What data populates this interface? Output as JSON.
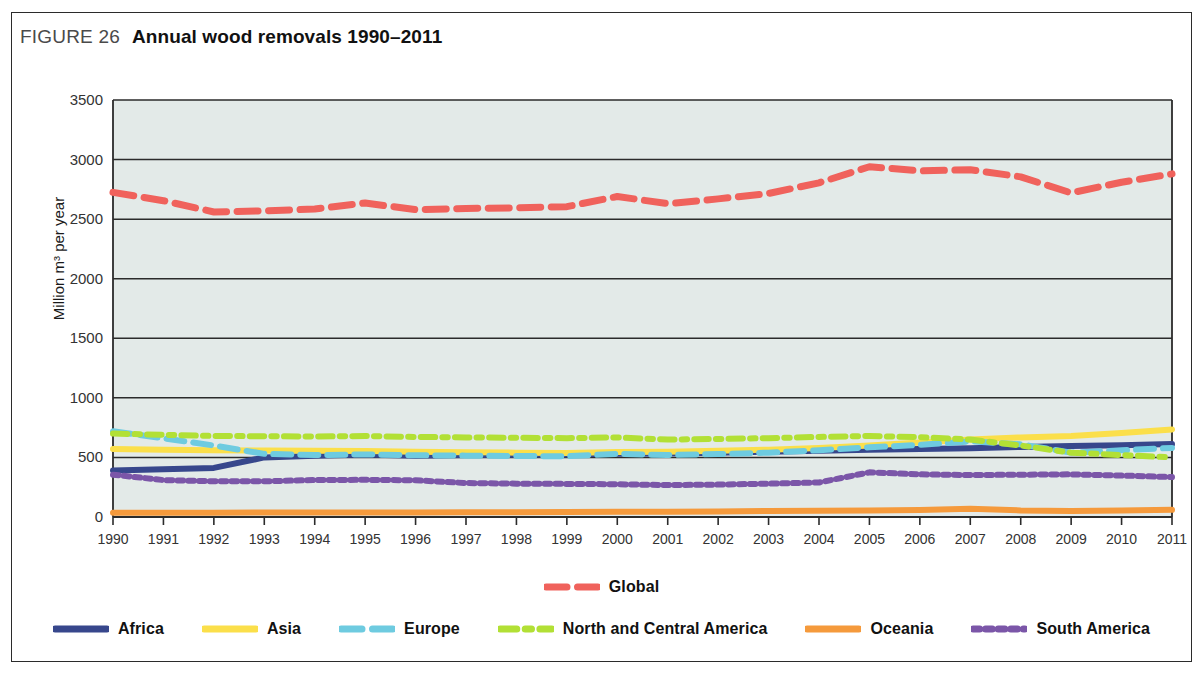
{
  "figure": {
    "label": "FIGURE 26",
    "title": "Annual wood removals 1990–2011"
  },
  "colors": {
    "global": "#f0625c",
    "africa": "#37478c",
    "asia": "#fbdf4a",
    "europe": "#6ecbe0",
    "north_and_central_america": "#b2e035",
    "oceania": "#f59a3c",
    "south_america": "#7b56a8",
    "plot_background": "#e3eae8",
    "gridline": "#2b2b2b",
    "frame": "#2b2b2b"
  },
  "chart_data": {
    "type": "line",
    "title": "Annual wood removals 1990–2011",
    "xlabel": "",
    "ylabel": "Million m³ per year",
    "ylim": [
      0,
      3500
    ],
    "ytick_values": [
      0,
      500,
      1000,
      1500,
      2000,
      2500,
      3000,
      3500
    ],
    "ytick_labels": [
      "0",
      "500",
      "1000",
      "1500",
      "2000",
      "2500",
      "3000",
      "3500"
    ],
    "grid": true,
    "legend_position": "bottom",
    "categories": [
      1990,
      1991,
      1992,
      1993,
      1994,
      1995,
      1996,
      1997,
      1998,
      1999,
      2000,
      2001,
      2002,
      2003,
      2004,
      2005,
      2006,
      2007,
      2008,
      2009,
      2010,
      2011
    ],
    "xtick_labels": [
      "1990",
      "1991",
      "1992",
      "1993",
      "1994",
      "1995",
      "1996",
      "1997",
      "1998",
      "1999",
      "2000",
      "2001",
      "2002",
      "2003",
      "2004",
      "2005",
      "2006",
      "2007",
      "2008",
      "2009",
      "2010",
      "2011"
    ],
    "series": [
      {
        "name": "Global",
        "color": "#f0625c",
        "style": "dashed",
        "values": [
          2725,
          2655,
          2560,
          2570,
          2585,
          2635,
          2580,
          2590,
          2595,
          2605,
          2690,
          2630,
          2670,
          2715,
          2805,
          2940,
          2905,
          2915,
          2855,
          2720,
          2810,
          2880
        ]
      },
      {
        "name": "Africa",
        "color": "#37478c",
        "style": "solid",
        "values": [
          390,
          400,
          412,
          500,
          515,
          525,
          515,
          520,
          523,
          525,
          530,
          532,
          540,
          548,
          556,
          565,
          570,
          578,
          588,
          595,
          602,
          612
        ]
      },
      {
        "name": "Asia",
        "color": "#fbdf4a",
        "style": "solid",
        "values": [
          570,
          565,
          560,
          558,
          556,
          554,
          548,
          544,
          540,
          538,
          545,
          548,
          556,
          565,
          580,
          600,
          625,
          650,
          668,
          680,
          705,
          735
        ]
      },
      {
        "name": "Europe",
        "color": "#6ecbe0",
        "style": "dashed",
        "values": [
          720,
          660,
          600,
          530,
          520,
          525,
          518,
          515,
          512,
          510,
          530,
          520,
          528,
          540,
          560,
          585,
          605,
          635,
          610,
          540,
          560,
          580
        ]
      },
      {
        "name": "North and Central America",
        "color": "#b2e035",
        "style": "dash-dot",
        "values": [
          700,
          690,
          680,
          678,
          675,
          680,
          672,
          668,
          665,
          662,
          668,
          650,
          655,
          662,
          672,
          680,
          670,
          650,
          600,
          540,
          520,
          500
        ]
      },
      {
        "name": "Oceania",
        "color": "#f59a3c",
        "style": "solid",
        "values": [
          35,
          35,
          36,
          37,
          38,
          38,
          38,
          39,
          40,
          42,
          44,
          45,
          47,
          50,
          52,
          55,
          58,
          70,
          55,
          50,
          55,
          60
        ]
      },
      {
        "name": "South America",
        "color": "#7b56a8",
        "style": "dotted",
        "values": [
          355,
          310,
          300,
          300,
          310,
          312,
          308,
          285,
          280,
          278,
          275,
          268,
          272,
          280,
          290,
          375,
          358,
          352,
          355,
          358,
          348,
          335
        ]
      }
    ]
  },
  "axis": {
    "y_label": "Million m³ per year"
  },
  "legend": {
    "rows": [
      [
        {
          "name": "Global",
          "label": "Global",
          "color": "#f0625c",
          "style": "dashed"
        }
      ],
      [
        {
          "name": "Africa",
          "label": "Africa",
          "color": "#37478c",
          "style": "solid"
        },
        {
          "name": "Asia",
          "label": "Asia",
          "color": "#fbdf4a",
          "style": "solid"
        },
        {
          "name": "Europe",
          "label": "Europe",
          "color": "#6ecbe0",
          "style": "dashed"
        },
        {
          "name": "North and Central America",
          "label": "North and Central America",
          "color": "#b2e035",
          "style": "dash-dot"
        },
        {
          "name": "Oceania",
          "label": "Oceania",
          "color": "#f59a3c",
          "style": "solid"
        },
        {
          "name": "South America",
          "label": "South America",
          "color": "#7b56a8",
          "style": "dotted"
        }
      ]
    ]
  }
}
